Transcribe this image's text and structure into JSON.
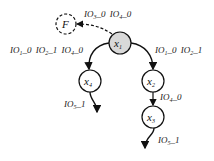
{
  "diagram": {
    "nodes": [
      {
        "id": "F",
        "label": "F",
        "sub": "",
        "style": "dashed"
      },
      {
        "id": "x1",
        "label": "x",
        "sub": "1",
        "style": "shaded"
      },
      {
        "id": "x4",
        "label": "x",
        "sub": "4",
        "style": "plain"
      },
      {
        "id": "x2",
        "label": "x",
        "sub": "2",
        "style": "plain"
      },
      {
        "id": "x3",
        "label": "x",
        "sub": "3",
        "style": "plain"
      }
    ],
    "edges": [
      {
        "from": "x1",
        "to": "F",
        "style": "dashed",
        "label": "IO3_0 IO4_0",
        "parts": [
          {
            "t": "IO",
            "s": "3",
            "v": "_0"
          },
          {
            "t": "IO",
            "s": "4",
            "v": "_0"
          }
        ]
      },
      {
        "from": "x1",
        "to": "x4",
        "style": "solid",
        "label": "IO1_0 IO2_1 IO4_0",
        "parts": [
          {
            "t": "IO",
            "s": "1",
            "v": "_0"
          },
          {
            "t": "IO",
            "s": "2",
            "v": "_1"
          },
          {
            "t": "IO",
            "s": "4",
            "v": "_0"
          }
        ]
      },
      {
        "from": "x1",
        "to": "x2",
        "style": "solid",
        "label": "IO1_0 IO2_1",
        "parts": [
          {
            "t": "IO",
            "s": "1",
            "v": "_0"
          },
          {
            "t": "IO",
            "s": "2",
            "v": "_1"
          }
        ]
      },
      {
        "from": "x4",
        "to": "out",
        "style": "solid",
        "label": "IO5_1",
        "parts": [
          {
            "t": "IO",
            "s": "5",
            "v": "_1"
          }
        ]
      },
      {
        "from": "x2",
        "to": "x3",
        "style": "solid",
        "label": "IO4_0",
        "parts": [
          {
            "t": "IO",
            "s": "4",
            "v": "_0"
          }
        ]
      },
      {
        "from": "x3",
        "to": "out",
        "style": "solid",
        "label": "IO5_1",
        "parts": [
          {
            "t": "IO",
            "s": "5",
            "v": "_1"
          }
        ]
      }
    ]
  }
}
